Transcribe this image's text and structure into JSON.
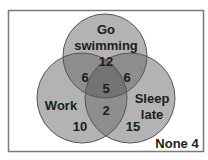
{
  "diagram": {
    "type": "venn",
    "sets": [
      {
        "id": "swim",
        "label_lines": [
          "Go",
          "swimming"
        ],
        "only_value": "12"
      },
      {
        "id": "work",
        "label_lines": [
          "Work"
        ],
        "only_value": "10"
      },
      {
        "id": "sleep",
        "label_lines": [
          "Sleep",
          "late"
        ],
        "only_value": "15"
      }
    ],
    "intersections": {
      "swim_work": "6",
      "swim_sleep": "6",
      "work_sleep": "2",
      "all_three": "5"
    },
    "outside": {
      "label": "None",
      "value": "4",
      "text": "None 4"
    }
  },
  "colors": {
    "circle_fill": "#b3b3b3",
    "pair_overlap": "#8e8e8e",
    "triple_overlap": "#747474",
    "circle_stroke": "#555555",
    "frame_stroke": "#7a7a7a",
    "text": "#1c1c1c"
  }
}
